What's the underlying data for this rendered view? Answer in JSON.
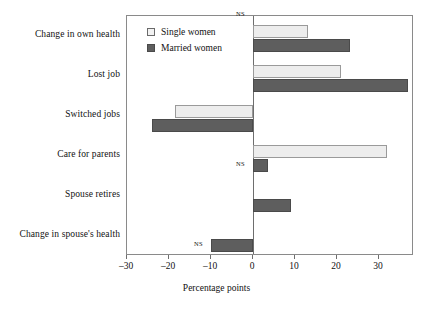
{
  "chart_data": {
    "type": "bar",
    "orientation": "horizontal",
    "title": "",
    "xlabel": "Percentage points",
    "ylabel": "",
    "xlim": [
      -33,
      35
    ],
    "xticks": [
      -30,
      -20,
      -10,
      0,
      10,
      20,
      30
    ],
    "xticklabels": [
      "–30",
      "–20",
      "–10",
      "0",
      "10",
      "20",
      "30"
    ],
    "grid": false,
    "legend_position": "top-left-inside",
    "categories": [
      "Change in own health",
      "Lost job",
      "Switched jobs",
      "Care for parents",
      "Spouse retires",
      "Change in spouse's health"
    ],
    "series": [
      {
        "name": "Single women",
        "color": "#ededed",
        "values": [
          13,
          21,
          -18.5,
          32,
          0,
          0
        ]
      },
      {
        "name": "Married women",
        "color": "#5e5e5e",
        "values": [
          23,
          37,
          -24,
          3.5,
          9,
          -10
        ]
      }
    ],
    "annotations": [
      {
        "text": "NS",
        "category": "Change in own health",
        "series": "Single women"
      },
      {
        "text": "NS",
        "category": "Care for parents",
        "series": "Married women"
      },
      {
        "text": "NS",
        "category": "Change in spouse's health",
        "series": "Married women"
      }
    ]
  },
  "legend": {
    "items": [
      {
        "label": "Single women",
        "swatch": "single"
      },
      {
        "label": "Married women",
        "swatch": "married"
      }
    ]
  },
  "axis": {
    "title": "Percentage points",
    "ticklabels": [
      "–30",
      "–20",
      "–10",
      "0",
      "10",
      "20",
      "30"
    ]
  },
  "categories": [
    "Change in own health",
    "Lost job",
    "Switched jobs",
    "Care for parents",
    "Spouse retires",
    "Change in spouse's health"
  ],
  "ns_label": "NS"
}
